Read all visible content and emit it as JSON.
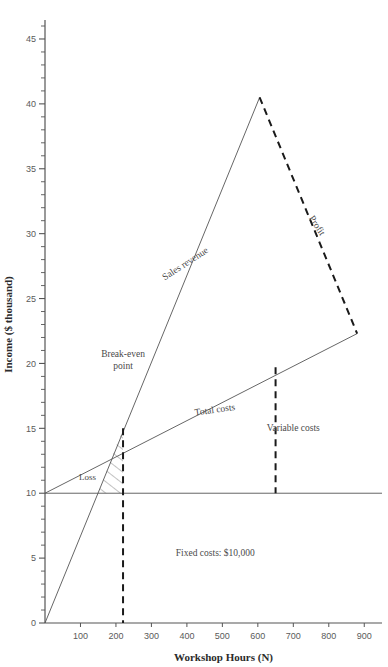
{
  "chart_data": {
    "type": "line",
    "title": "",
    "xlabel": "Workshop Hours (N)",
    "ylabel": "Income ($ thousand)",
    "xlim": [
      0,
      950
    ],
    "ylim": [
      0,
      46
    ],
    "grid": false,
    "legend": "none",
    "x_ticks": [
      100,
      200,
      300,
      400,
      500,
      600,
      700,
      800,
      900
    ],
    "x_tick_labels": [
      "100",
      "200",
      "300",
      "400",
      "500",
      "600",
      "700",
      "800",
      "900"
    ],
    "y_ticks": [
      0,
      5,
      10,
      15,
      20,
      25,
      30,
      35,
      40,
      45
    ],
    "y_tick_labels": [
      "0",
      "5",
      "10",
      "15",
      "20",
      "25",
      "30",
      "35",
      "40",
      "45"
    ],
    "y_minor_step": 1,
    "series": [
      {
        "name": "Sales revenue",
        "style": "solid",
        "points": [
          [
            0,
            0
          ],
          [
            605,
            40.5
          ]
        ]
      },
      {
        "name": "Total costs",
        "style": "solid",
        "points": [
          [
            0,
            10
          ],
          [
            880,
            22.3
          ]
        ]
      },
      {
        "name": "Fixed costs",
        "style": "solid",
        "points": [
          [
            0,
            10
          ],
          [
            950,
            10
          ]
        ]
      },
      {
        "name": "Profit",
        "style": "dashed",
        "points": [
          [
            605,
            40.5
          ],
          [
            880,
            22.3
          ]
        ]
      },
      {
        "name": "Break-even point",
        "style": "dashed",
        "points": [
          [
            220,
            15
          ],
          [
            220,
            0
          ]
        ]
      },
      {
        "name": "Variable costs",
        "style": "dashed",
        "points": [
          [
            650,
            19.7
          ],
          [
            650,
            10
          ]
        ]
      }
    ],
    "break_even": {
      "x": 220,
      "y": 15
    },
    "annotations": [
      {
        "name": "break-even-point",
        "text_line1": "Break-even",
        "text_line2": "point",
        "x": 220,
        "y": 20.5
      },
      {
        "name": "sales-revenue",
        "text": "Sales revenue",
        "x": 400,
        "y": 27.5,
        "rotation": -33
      },
      {
        "name": "total-costs",
        "text": "Total costs",
        "x": 480,
        "y": 16.2,
        "rotation": -8
      },
      {
        "name": "profit",
        "text": "Profit",
        "x": 760,
        "y": 30.5,
        "rotation": 57
      },
      {
        "name": "variable-costs",
        "text": "Variable costs",
        "x": 700,
        "y": 14.8
      },
      {
        "name": "loss",
        "text": "Loss",
        "x": 120,
        "y": 11.0
      },
      {
        "name": "fixed-costs-note",
        "text": "Fixed costs: $10,000",
        "x": 480,
        "y": 5.2
      }
    ]
  },
  "labels": {
    "x_axis_title": "Workshop Hours (N)",
    "y_axis_title": "Income ($ thousand)",
    "break_even_line1": "Break-even",
    "break_even_line2": "point",
    "sales_revenue": "Sales revenue",
    "total_costs": "Total costs",
    "variable_costs": "Variable costs",
    "profit": "Profit",
    "loss": "Loss",
    "fixed_costs_note": "Fixed costs: $10,000"
  },
  "colors": {
    "axis": "#555555",
    "line": "#555555",
    "dashed": "#1a1a1a",
    "text": "#4a4a4a",
    "background": "#ffffff"
  }
}
